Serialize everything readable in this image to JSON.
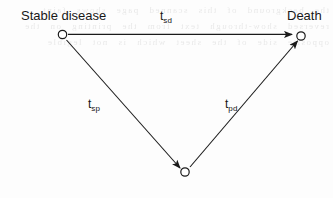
{
  "figure": {
    "type": "state-transition-diagram",
    "background_text": "the background of this scanned page shows faint reversed show-through text from the printing on the opposite side of the sheet which is not legible"
  },
  "nodes": [
    {
      "id": "stable",
      "label": "Stable disease",
      "marker": "open-circle",
      "x": 62,
      "y": 35,
      "label_x": 21,
      "label_y": 8
    },
    {
      "id": "progression",
      "label": "",
      "marker": "open-circle",
      "x": 185,
      "y": 172
    },
    {
      "id": "death",
      "label": "Death",
      "marker": "open-circle",
      "x": 301,
      "y": 36,
      "label_x": 287,
      "label_y": 8
    }
  ],
  "edges": [
    {
      "id": "sd",
      "from": "stable",
      "to": "death",
      "base": "t",
      "subscript": "sd",
      "label_x": 160,
      "label_y": 9,
      "arrowhead": "filled"
    },
    {
      "id": "sp",
      "from": "stable",
      "to": "progression",
      "base": "t",
      "subscript": "sp",
      "label_x": 88,
      "label_y": 97,
      "arrowhead": "filled"
    },
    {
      "id": "pd",
      "from": "progression",
      "to": "death",
      "base": "t",
      "subscript": "pd",
      "label_x": 225,
      "label_y": 97,
      "arrowhead": "filled"
    }
  ],
  "style": {
    "line_color": "#1a1a1a",
    "node_stroke": "#1a1a1a",
    "node_fill": "#ffffff",
    "text_color": "#181818",
    "page_color": "#fdfdfd"
  }
}
